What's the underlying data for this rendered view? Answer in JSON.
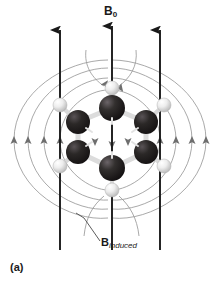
{
  "figure": {
    "panel_label": "(a)",
    "field_label_main": "B",
    "field_label_main_sub": "0",
    "induced_label_main": "B",
    "induced_label_sub": "induced",
    "caption_topic": "Benzene ring current anisotropy in an applied magnetic field"
  },
  "colors": {
    "background": "#ffffff",
    "carbon_dark": "#231f20",
    "carbon_dark_edge": "#0d0c0c",
    "carbon_highlight": "#5a5458",
    "hydrogen_light": "#e8e8e8",
    "hydrogen_edge": "#aaaaaa",
    "hydrogen_highlight": "#ffffff",
    "bond_light": "#d8d8d8",
    "field_line": "#9a9a9a",
    "field_arrow": "#6e6e6e",
    "applied_field_arrow": "#1a1a1a",
    "text": "#1a1a1a",
    "leader_line": "#4a4a4a"
  },
  "applied_field": {
    "name": "B0",
    "direction": "up",
    "arrow_count": 3,
    "arrow_x_positions": [
      60,
      112,
      160
    ],
    "arrow_top_y": 28,
    "arrow_bottom_y": 250,
    "label": "B0"
  },
  "induced_field": {
    "name": "B induced",
    "description": "ring current induced field, concentric loops around the benzene ring",
    "loop_count_per_side": 4,
    "direction_at_ring_center": "down",
    "direction_outside_ring": "up",
    "label": "B induced"
  },
  "molecule": {
    "name": "benzene",
    "formula": "C6H6",
    "carbon_count": 6,
    "hydrogen_count": 6,
    "carbons": [
      {
        "id": "C1",
        "cx": 112,
        "cy": 108,
        "r": 13,
        "z": 3
      },
      {
        "id": "C2",
        "cx": 78,
        "cy": 122,
        "r": 12,
        "z": 2
      },
      {
        "id": "C3",
        "cx": 78,
        "cy": 152,
        "r": 12,
        "z": 2
      },
      {
        "id": "C4",
        "cx": 112,
        "cy": 168,
        "r": 13,
        "z": 3
      },
      {
        "id": "C5",
        "cx": 146,
        "cy": 152,
        "r": 12,
        "z": 2
      },
      {
        "id": "C6",
        "cx": 146,
        "cy": 122,
        "r": 12,
        "z": 2
      }
    ],
    "hydrogens": [
      {
        "id": "H1",
        "cx": 112,
        "cy": 88,
        "r": 7
      },
      {
        "id": "H2",
        "cx": 60,
        "cy": 105,
        "r": 7
      },
      {
        "id": "H3",
        "cx": 60,
        "cy": 166,
        "r": 7
      },
      {
        "id": "H4",
        "cx": 112,
        "cy": 190,
        "r": 7
      },
      {
        "id": "H5",
        "cx": 164,
        "cy": 166,
        "r": 7
      },
      {
        "id": "H6",
        "cx": 164,
        "cy": 105,
        "r": 7
      }
    ]
  },
  "leader": {
    "from_x": 96,
    "from_y": 219,
    "to_x": 101,
    "to_y": 240,
    "note": "leader line from induced field line to B induced label"
  }
}
